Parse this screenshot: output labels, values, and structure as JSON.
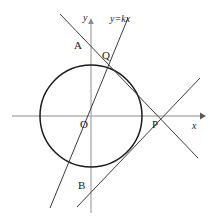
{
  "figure": {
    "kind": "analytic-geometry-diagram",
    "width": 210,
    "height": 219,
    "background": "#ffffff",
    "stroke_color": "#1a1a1a",
    "axis_color": "#8c8c8c",
    "labels": {
      "x_axis": "x",
      "y_axis": "y",
      "origin": "O",
      "point_a": "A",
      "point_b": "B",
      "point_p": "P",
      "point_q": "Q",
      "line_equation": "y=kx"
    },
    "label_positions": {
      "x_axis": {
        "x": 192,
        "y": 121
      },
      "y_axis": {
        "x": 83,
        "y": 13
      },
      "origin": {
        "x": 80,
        "y": 119
      },
      "point_a": {
        "x": 74,
        "y": 40
      },
      "point_b": {
        "x": 78,
        "y": 180
      },
      "point_p": {
        "x": 152,
        "y": 119
      },
      "point_q": {
        "x": 102,
        "y": 50
      },
      "line_equation": {
        "x": 110,
        "y": 14
      }
    },
    "circle": {
      "cx": 91,
      "cy": 116,
      "r": 51
    },
    "axes": {
      "x": {
        "x1": 12,
        "y1": 116,
        "x2": 202,
        "y2": 116,
        "arrow": "right"
      },
      "y": {
        "x1": 91,
        "y1": 20,
        "x2": 91,
        "y2": 213,
        "arrow": "up"
      }
    },
    "lines": [
      {
        "name": "y=kx",
        "x1": 50,
        "y1": 208,
        "x2": 128,
        "y2": 18
      },
      {
        "name": "line-APQ",
        "x1": 60,
        "y1": 14,
        "x2": 198,
        "y2": 158
      },
      {
        "name": "line-BP",
        "x1": 77,
        "y1": 207,
        "x2": 200,
        "y2": 78
      }
    ],
    "points": {
      "O": {
        "x": 91,
        "y": 116
      },
      "P": {
        "x": 158,
        "y": 116
      },
      "Q": {
        "x": 113,
        "y": 68
      }
    }
  }
}
